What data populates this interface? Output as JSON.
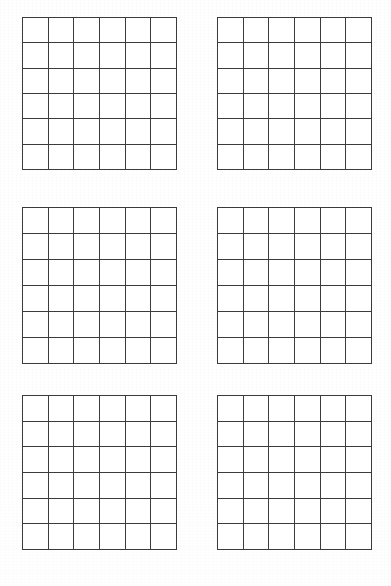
{
  "page": {
    "background_color": "#ffffff",
    "width": 391,
    "height": 586
  },
  "style": {
    "line_color": "#3b3b3b",
    "line_width_px": 1.6,
    "cell_fill": "#ffffff"
  },
  "layout": {
    "columns": 2,
    "rows": 3,
    "grid_count": 6
  },
  "grids": [
    {
      "name": "grid-top-left",
      "rows": 6,
      "cols": 6,
      "x": 22,
      "y": 17,
      "width": 155,
      "height": 153,
      "cells": [
        [
          "",
          "",
          "",
          "",
          "",
          ""
        ],
        [
          "",
          "",
          "",
          "",
          "",
          ""
        ],
        [
          "",
          "",
          "",
          "",
          "",
          ""
        ],
        [
          "",
          "",
          "",
          "",
          "",
          ""
        ],
        [
          "",
          "",
          "",
          "",
          "",
          ""
        ],
        [
          "",
          "",
          "",
          "",
          "",
          ""
        ]
      ]
    },
    {
      "name": "grid-top-right",
      "rows": 6,
      "cols": 6,
      "x": 217,
      "y": 17,
      "width": 155,
      "height": 153,
      "cells": [
        [
          "",
          "",
          "",
          "",
          "",
          ""
        ],
        [
          "",
          "",
          "",
          "",
          "",
          ""
        ],
        [
          "",
          "",
          "",
          "",
          "",
          ""
        ],
        [
          "",
          "",
          "",
          "",
          "",
          ""
        ],
        [
          "",
          "",
          "",
          "",
          "",
          ""
        ],
        [
          "",
          "",
          "",
          "",
          "",
          ""
        ]
      ]
    },
    {
      "name": "grid-middle-left",
      "rows": 6,
      "cols": 6,
      "x": 22,
      "y": 207,
      "width": 155,
      "height": 157,
      "cells": [
        [
          "",
          "",
          "",
          "",
          "",
          ""
        ],
        [
          "",
          "",
          "",
          "",
          "",
          ""
        ],
        [
          "",
          "",
          "",
          "",
          "",
          ""
        ],
        [
          "",
          "",
          "",
          "",
          "",
          ""
        ],
        [
          "",
          "",
          "",
          "",
          "",
          ""
        ],
        [
          "",
          "",
          "",
          "",
          "",
          ""
        ]
      ]
    },
    {
      "name": "grid-middle-right",
      "rows": 6,
      "cols": 6,
      "x": 217,
      "y": 207,
      "width": 155,
      "height": 157,
      "cells": [
        [
          "",
          "",
          "",
          "",
          "",
          ""
        ],
        [
          "",
          "",
          "",
          "",
          "",
          ""
        ],
        [
          "",
          "",
          "",
          "",
          "",
          ""
        ],
        [
          "",
          "",
          "",
          "",
          "",
          ""
        ],
        [
          "",
          "",
          "",
          "",
          "",
          ""
        ],
        [
          "",
          "",
          "",
          "",
          "",
          ""
        ]
      ]
    },
    {
      "name": "grid-bottom-left",
      "rows": 6,
      "cols": 6,
      "x": 22,
      "y": 395,
      "width": 155,
      "height": 155,
      "cells": [
        [
          "",
          "",
          "",
          "",
          "",
          ""
        ],
        [
          "",
          "",
          "",
          "",
          "",
          ""
        ],
        [
          "",
          "",
          "",
          "",
          "",
          ""
        ],
        [
          "",
          "",
          "",
          "",
          "",
          ""
        ],
        [
          "",
          "",
          "",
          "",
          "",
          ""
        ],
        [
          "",
          "",
          "",
          "",
          "",
          ""
        ]
      ]
    },
    {
      "name": "grid-bottom-right",
      "rows": 6,
      "cols": 6,
      "x": 217,
      "y": 395,
      "width": 155,
      "height": 155,
      "cells": [
        [
          "",
          "",
          "",
          "",
          "",
          ""
        ],
        [
          "",
          "",
          "",
          "",
          "",
          ""
        ],
        [
          "",
          "",
          "",
          "",
          "",
          ""
        ],
        [
          "",
          "",
          "",
          "",
          "",
          ""
        ],
        [
          "",
          "",
          "",
          "",
          "",
          ""
        ],
        [
          "",
          "",
          "",
          "",
          "",
          ""
        ]
      ]
    }
  ]
}
